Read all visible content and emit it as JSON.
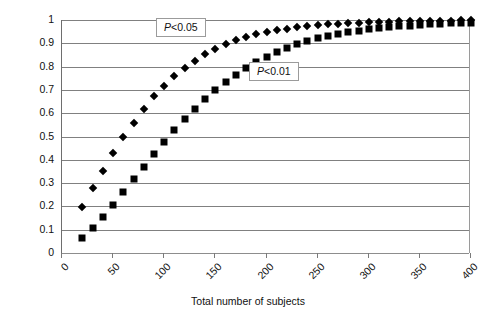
{
  "chart_data": {
    "type": "scatter",
    "title": "",
    "xlabel": "Total number of subjects",
    "ylabel": "Power",
    "xlim": [
      0,
      400
    ],
    "ylim": [
      0,
      1
    ],
    "xticks": [
      0,
      50,
      100,
      150,
      200,
      250,
      300,
      350,
      400
    ],
    "xtick_labels": [
      "0",
      "50",
      "100",
      "150",
      "200",
      "250",
      "300",
      "350",
      "400"
    ],
    "yticks": [
      0,
      0.1,
      0.2,
      0.3,
      0.4,
      0.5,
      0.6,
      0.7,
      0.8,
      0.9,
      1
    ],
    "ytick_labels": [
      "0",
      "0.1",
      "0.2",
      "0.3",
      "0.4",
      "0.5",
      "0.6",
      "0.7",
      "0.8",
      "0.9",
      "1"
    ],
    "grid": "horizontal",
    "legend_position": "inside-annotations",
    "series": [
      {
        "name": "P < 0.05",
        "marker": "diamond",
        "color": "#000000",
        "x": [
          20,
          30,
          40,
          50,
          60,
          70,
          80,
          90,
          100,
          110,
          120,
          130,
          140,
          150,
          160,
          170,
          180,
          190,
          200,
          210,
          220,
          230,
          240,
          250,
          260,
          270,
          280,
          290,
          300,
          310,
          320,
          330,
          340,
          350,
          360,
          370,
          380,
          390,
          400
        ],
        "y": [
          0.197,
          0.277,
          0.35,
          0.43,
          0.497,
          0.56,
          0.618,
          0.672,
          0.717,
          0.758,
          0.795,
          0.826,
          0.853,
          0.877,
          0.897,
          0.913,
          0.927,
          0.939,
          0.948,
          0.956,
          0.963,
          0.969,
          0.974,
          0.978,
          0.981,
          0.984,
          0.986,
          0.988,
          0.99,
          0.991,
          0.993,
          0.994,
          0.995,
          0.995,
          0.996,
          0.997,
          0.997,
          0.998,
          0.998
        ]
      },
      {
        "name": "P < 0.01",
        "marker": "square",
        "color": "#000000",
        "x": [
          20,
          30,
          40,
          50,
          60,
          70,
          80,
          90,
          100,
          110,
          120,
          130,
          140,
          150,
          160,
          170,
          180,
          190,
          200,
          210,
          220,
          230,
          240,
          250,
          260,
          270,
          280,
          290,
          300,
          310,
          320,
          330,
          340,
          350,
          360,
          370,
          380,
          390,
          400
        ],
        "y": [
          0.065,
          0.108,
          0.156,
          0.206,
          0.261,
          0.316,
          0.371,
          0.425,
          0.477,
          0.527,
          0.574,
          0.617,
          0.659,
          0.698,
          0.733,
          0.765,
          0.794,
          0.82,
          0.843,
          0.863,
          0.881,
          0.896,
          0.91,
          0.921,
          0.931,
          0.94,
          0.948,
          0.954,
          0.96,
          0.965,
          0.969,
          0.973,
          0.976,
          0.979,
          0.981,
          0.984,
          0.986,
          0.987,
          0.989
        ]
      }
    ],
    "annotations": [
      {
        "text": "P < 0.05",
        "italic_part": "P",
        "operator": "<",
        "value": "0.05",
        "x": 125,
        "y": 0.955
      },
      {
        "text": "P < 0.01",
        "italic_part": "P",
        "operator": "<",
        "value": "0.01",
        "x": 215,
        "y": 0.77
      }
    ]
  },
  "axes": {
    "y_title": "Power",
    "x_title": "Total number of subjects"
  }
}
